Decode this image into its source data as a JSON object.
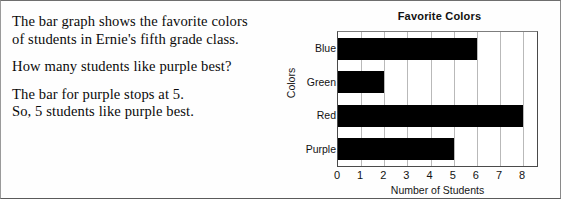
{
  "lesson": {
    "paragraphs": [
      "The bar graph shows the favorite colors\nof students in Ernie's fifth grade class.",
      "How many students like purple best?",
      "The bar for purple stops at 5.\nSo, 5 students like purple best."
    ]
  },
  "chart_data": {
    "type": "bar",
    "orientation": "horizontal",
    "title": "Favorite Colors",
    "xlabel": "Number of Students",
    "ylabel": "Colors",
    "categories": [
      "Blue",
      "Green",
      "Red",
      "Purple"
    ],
    "values": [
      6,
      2,
      8,
      5
    ],
    "xticks": [
      0,
      1,
      2,
      3,
      4,
      5,
      6,
      7,
      8
    ],
    "xlim": [
      0,
      8.6
    ],
    "grid": "vertical",
    "legend": "none",
    "bar_color": "#000000",
    "series": [
      {
        "name": "Number of Students",
        "values": [
          6,
          2,
          8,
          5
        ]
      }
    ]
  }
}
